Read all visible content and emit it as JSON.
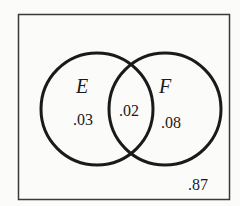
{
  "diagram": {
    "type": "venn",
    "universe": {
      "label": "",
      "outside_value": ".87"
    },
    "sets": [
      {
        "name": "E",
        "only_value": ".03"
      },
      {
        "name": "F",
        "only_value": ".08"
      }
    ],
    "intersection": {
      "sets": [
        "E",
        "F"
      ],
      "value": ".02"
    },
    "colors": {
      "stroke": "#1a1a1a",
      "background": "#fbfbfa"
    }
  }
}
